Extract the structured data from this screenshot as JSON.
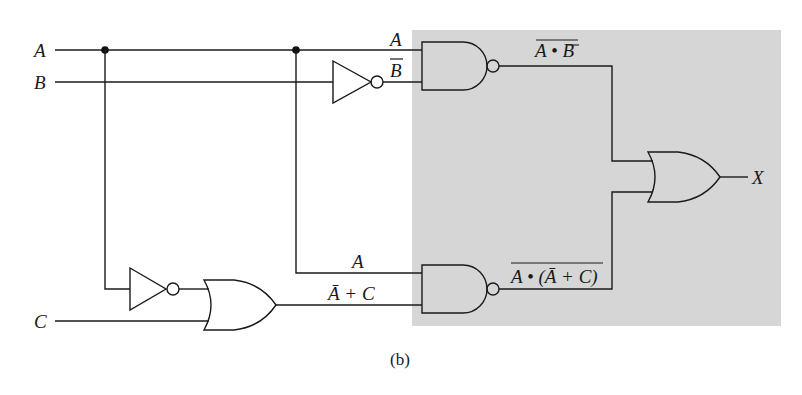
{
  "diagram": {
    "type": "logic-circuit",
    "caption": "(b)",
    "inputs": {
      "a": "A",
      "b": "B",
      "c": "C"
    },
    "output": "X",
    "shaded_region_color": "#d6d6d6",
    "wire_labels": {
      "nand1_in_a": "A",
      "nand1_in_b": "B",
      "nand1_in_b_bar": "‾",
      "nand1_out": "A • B",
      "nand2_in_a": "A",
      "nand2_in_sum": "Ā + C",
      "nand2_out": "A • (Ā + C)"
    },
    "gates": [
      {
        "id": "inv1",
        "type": "NOT",
        "input": "B",
        "output": "B̄"
      },
      {
        "id": "nand1",
        "type": "NAND",
        "inputs": [
          "A",
          "B̄"
        ],
        "output": "¬(A • B̄)"
      },
      {
        "id": "inv2",
        "type": "NOT",
        "input": "A",
        "output": "Ā"
      },
      {
        "id": "or1",
        "type": "OR",
        "inputs": [
          "Ā",
          "C"
        ],
        "output": "Ā + C"
      },
      {
        "id": "nand2",
        "type": "NAND",
        "inputs": [
          "A",
          "Ā + C"
        ],
        "output": "¬(A • (Ā + C))"
      },
      {
        "id": "or2",
        "type": "OR",
        "inputs": [
          "¬(A • B̄)",
          "¬(A • (Ā + C))"
        ],
        "output": "X"
      }
    ]
  }
}
